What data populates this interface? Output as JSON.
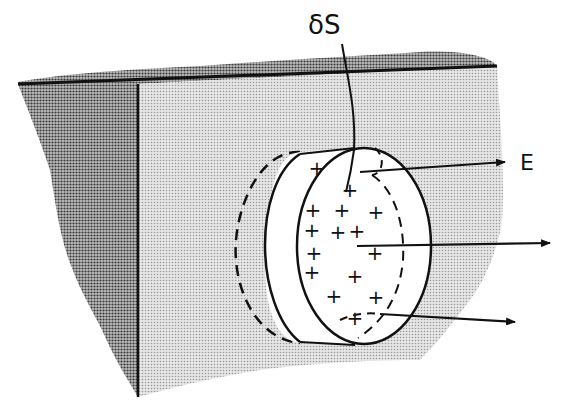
{
  "figure": {
    "labels": {
      "surface_element": "δS",
      "field": "E"
    },
    "charge_symbol": "+",
    "charges": [
      {
        "x": 317,
        "y": 168
      },
      {
        "x": 350,
        "y": 190
      },
      {
        "x": 313,
        "y": 210
      },
      {
        "x": 342,
        "y": 210
      },
      {
        "x": 376,
        "y": 212
      },
      {
        "x": 338,
        "y": 232
      },
      {
        "x": 312,
        "y": 230
      },
      {
        "x": 357,
        "y": 231
      },
      {
        "x": 314,
        "y": 253
      },
      {
        "x": 375,
        "y": 253
      },
      {
        "x": 312,
        "y": 272
      },
      {
        "x": 355,
        "y": 276
      },
      {
        "x": 334,
        "y": 296
      },
      {
        "x": 376,
        "y": 297
      },
      {
        "x": 355,
        "y": 318
      }
    ],
    "arrows": [
      {
        "name": "field-arrow-top",
        "x1": 360,
        "y1": 172,
        "x2": 505,
        "y2": 162
      },
      {
        "name": "field-arrow-middle",
        "x1": 357,
        "y1": 246,
        "x2": 550,
        "y2": 243
      },
      {
        "name": "field-arrow-bottom",
        "x1": 380,
        "y1": 314,
        "x2": 515,
        "y2": 322
      }
    ],
    "colors": {
      "ink": "#111111",
      "face_shade": "#d2d2d2",
      "top_shade": "#9a9a9a",
      "side_shade": "#8c8c8c",
      "pillbox_fill": "#ffffff"
    }
  }
}
